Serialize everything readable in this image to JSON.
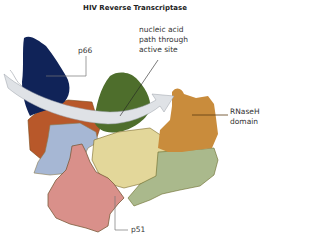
{
  "title": "HIV Reverse Transcriptase",
  "labels": {
    "p66": "p66",
    "nucleic_acid_line1": "nucleic acid",
    "nucleic_acid_line2": "path through",
    "nucleic_acid_line3": "active site",
    "rnaseh_line1": "RNaseH",
    "rnaseh_line2": "domain",
    "p51": "p51"
  },
  "colors": {
    "fingers_p66": "#102358",
    "palm_p66": "#b8582a",
    "thumb_p66": "#4e6e2c",
    "connection_p66": "#e3d79a",
    "rnaseh": "#c98c3c",
    "p51_blue": "#a6b7d4",
    "p51_pink": "#d9908a",
    "p51_green": "#aab98c",
    "arrow": "#d8dbe0"
  }
}
